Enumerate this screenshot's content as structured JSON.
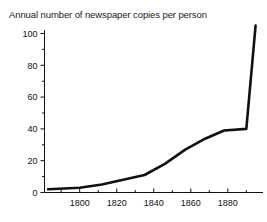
{
  "chart_data": {
    "type": "line",
    "title": "Annual number of newspaper copies per person",
    "xlabel": "",
    "ylabel": "",
    "xlim": [
      1781,
      1899
    ],
    "ylim": [
      0,
      108
    ],
    "grid": false,
    "legend": "none",
    "x_ticks_major": [
      1800,
      1820,
      1840,
      1860,
      1880
    ],
    "x_ticks_minor": [
      1790,
      1810,
      1830,
      1850,
      1870,
      1890
    ],
    "y_ticks_major": [
      0,
      20,
      40,
      60,
      80,
      100
    ],
    "y_ticks_minor": [
      10,
      30,
      50,
      70,
      90
    ],
    "x_tick_labels": [
      "1800",
      "1820",
      "1840",
      "1860",
      "1880"
    ],
    "y_tick_labels": [
      "0",
      "20",
      "40",
      "60",
      "80",
      "100"
    ],
    "series": [
      {
        "name": "Newspaper copies per person",
        "color": "#111111",
        "x": [
          1783,
          1800,
          1812,
          1835,
          1846,
          1857,
          1868,
          1878,
          1890,
          1895
        ],
        "values": [
          2,
          3,
          5,
          11,
          18,
          27,
          34,
          39,
          40,
          105
        ]
      }
    ]
  }
}
